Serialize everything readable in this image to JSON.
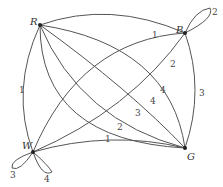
{
  "vertices": {
    "R": {
      "label": "R"
    },
    "B": {
      "label": "B"
    },
    "W": {
      "label": "W"
    },
    "G": {
      "label": "G"
    }
  },
  "edge_labels": {
    "rb": "1",
    "rw": "1",
    "bb_loop": "2",
    "bg": "3",
    "bw": "2",
    "ww_loop_a": "3",
    "ww_loop_b": "4",
    "wg": "1",
    "rg1": "2",
    "rg2": "3",
    "rg3": "4",
    "rg4": "4"
  },
  "colors": {
    "stroke": "#555555",
    "vertex": "#222222"
  }
}
